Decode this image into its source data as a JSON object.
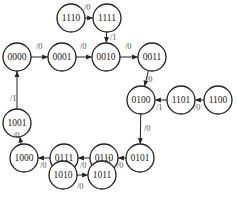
{
  "diagram": {
    "type": "state-transition",
    "radius": 14,
    "nodes": [
      {
        "id": "1110",
        "label": "1110",
        "x": 71,
        "y": 18
      },
      {
        "id": "1111",
        "label": "1111",
        "x": 107,
        "y": 18
      },
      {
        "id": "0000",
        "label": "0000",
        "x": 17,
        "y": 57
      },
      {
        "id": "0001",
        "label": "0001",
        "x": 62,
        "y": 57
      },
      {
        "id": "0010",
        "label": "0010",
        "x": 106,
        "y": 57
      },
      {
        "id": "0011",
        "label": "0011",
        "x": 152,
        "y": 57
      },
      {
        "id": "0100",
        "label": "0100",
        "x": 141,
        "y": 100
      },
      {
        "id": "1101",
        "label": "1101",
        "x": 181,
        "y": 100
      },
      {
        "id": "1100",
        "label": "1100",
        "x": 218,
        "y": 100
      },
      {
        "id": "1001",
        "label": "1001",
        "x": 17,
        "y": 123
      },
      {
        "id": "1000",
        "label": "1000",
        "x": 24,
        "y": 158
      },
      {
        "id": "0111",
        "label": "0111",
        "x": 64,
        "y": 158
      },
      {
        "id": "0110",
        "label": "0110",
        "x": 104,
        "y": 158
      },
      {
        "id": "0101",
        "label": "0101",
        "x": 140,
        "y": 158
      },
      {
        "id": "1010",
        "label": "1010",
        "x": 63,
        "y": 175
      },
      {
        "id": "1011",
        "label": "1011",
        "x": 102,
        "y": 175
      }
    ],
    "edges": [
      {
        "from": "1110",
        "to": "1111",
        "label": "/0",
        "lx": 84,
        "ly": 10
      },
      {
        "from": "1111",
        "to": "0010",
        "label": "/1",
        "lx": 110,
        "ly": 40
      },
      {
        "from": "0000",
        "to": "0001",
        "label": "/0",
        "lx": 36,
        "ly": 49
      },
      {
        "from": "0001",
        "to": "0010",
        "label": "/0",
        "lx": 80,
        "ly": 49
      },
      {
        "from": "0010",
        "to": "0011",
        "label": "/0",
        "lx": 125,
        "ly": 49
      },
      {
        "from": "0011",
        "to": "0100",
        "label": "/0",
        "lx": 146,
        "ly": 82
      },
      {
        "from": "1100",
        "to": "1101",
        "label": "/0",
        "lx": 194,
        "ly": 110
      },
      {
        "from": "1101",
        "to": "0100",
        "label": "/1",
        "lx": 156,
        "ly": 110
      },
      {
        "from": "0100",
        "to": "0101",
        "label": "/0",
        "lx": 144,
        "ly": 131
      },
      {
        "from": "0101",
        "to": "0110",
        "label": "/0",
        "lx": 117,
        "ly": 168
      },
      {
        "from": "0110",
        "to": "0111",
        "label": "/0",
        "lx": 80,
        "ly": 168
      },
      {
        "from": "0111",
        "to": "1000",
        "label": "/0",
        "lx": 40,
        "ly": 168
      },
      {
        "from": "1000",
        "to": "1001",
        "label": "/0",
        "lx": 13,
        "ly": 138
      },
      {
        "from": "1001",
        "to": "0000",
        "label": "/1",
        "lx": 10,
        "ly": 101
      },
      {
        "from": "1011",
        "to": "0110",
        "label": "/1",
        "lx": 105,
        "ly": 163
      },
      {
        "from": "1010",
        "to": "1011",
        "label": "/0",
        "lx": 77,
        "ly": 189
      }
    ]
  }
}
